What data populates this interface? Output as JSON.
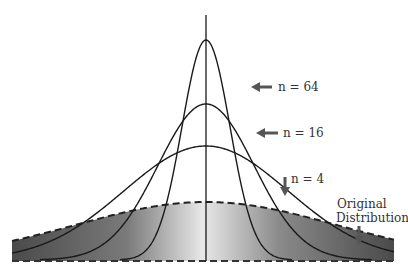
{
  "diagram": {
    "labels": {
      "n64": "n = 64",
      "n16": "n = 16",
      "n4": "n = 4",
      "original_line1": "Original",
      "original_line2": "Distribution"
    },
    "curves": [
      {
        "name": "n = 64",
        "peak_y": 40,
        "sigma_px": 24
      },
      {
        "name": "n = 16",
        "peak_y": 104,
        "sigma_px": 48
      },
      {
        "name": "n = 4",
        "peak_y": 146,
        "sigma_px": 82
      },
      {
        "name": "Original Distribution",
        "peak_y": 202,
        "sigma_px": 130,
        "style": "dashed, shaded"
      }
    ],
    "colors": {
      "curve": "#1a1a1a",
      "arrow": "#555555",
      "shade_dark": "#5a5a5a",
      "shade_light": "#e6e6e6",
      "text": "#333333"
    }
  }
}
